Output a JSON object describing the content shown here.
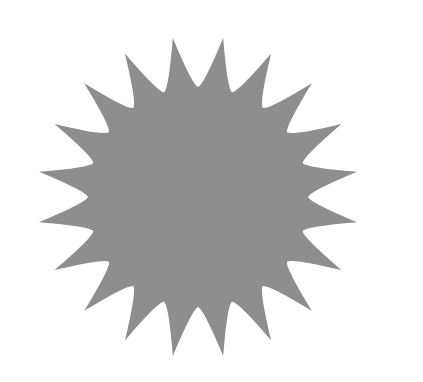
{
  "shape": {
    "type": "starburst",
    "points": 20,
    "center": [
      198,
      197
    ],
    "outer_radius": 161,
    "inner_radius": 110,
    "rotation_offset_deg": 9,
    "fill": "#8e8e8e",
    "background": "#ffffff"
  }
}
